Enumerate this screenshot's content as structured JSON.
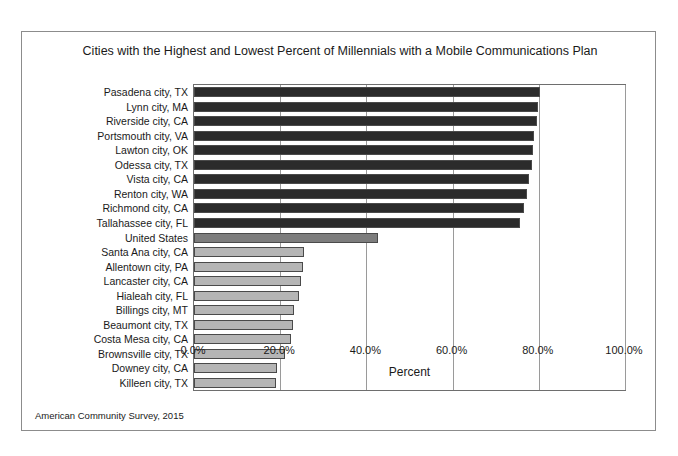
{
  "figure": {
    "title": "Cities with the Highest and Lowest Percent of Millennials with a Mobile Communications Plan",
    "source_note": "American Community Survey, 2015"
  },
  "colors": {
    "high_bar": "#2b2b2b",
    "national_bar": "#7d7d7d",
    "low_bar": "#b5b5b5",
    "bar_outline": "#4a4a4a",
    "gridline": "#9a9a9a",
    "frame": "#8c8c8c",
    "text": "#1a1a1a",
    "background": "#ffffff"
  },
  "chart_data": {
    "type": "bar",
    "orientation": "horizontal",
    "title": "Cities with the Highest and Lowest Percent of Millennials with a Mobile Communications Plan",
    "xlabel": "Percent",
    "ylabel": "",
    "xlim": [
      0,
      100
    ],
    "xticks": [
      0,
      20,
      40,
      60,
      80,
      100
    ],
    "xticklabels": [
      "0.0%",
      "20.0%",
      "40.0%",
      "60.0%",
      "80.0%",
      "100.0%"
    ],
    "grid": "vertical",
    "legend": "none",
    "categories": [
      "Pasadena city, TX",
      "Lynn city, MA",
      "Riverside city, CA",
      "Portsmouth city, VA",
      "Lawton city, OK",
      "Odessa city, TX",
      "Vista city, CA",
      "Renton city, WA",
      "Richmond city, CA",
      "Tallahassee city, FL",
      "United States",
      "Santa Ana city, CA",
      "Allentown city, PA",
      "Lancaster city, CA",
      "Hialeah city, FL",
      "Billings city, MT",
      "Beaumont city, TX",
      "Costa Mesa city, CA",
      "Brownsville city, TX",
      "Downey city, CA",
      "Killeen city, TX"
    ],
    "values": [
      80.3,
      79.8,
      79.6,
      79.0,
      78.7,
      78.4,
      77.8,
      77.3,
      76.5,
      75.6,
      42.8,
      25.5,
      25.4,
      24.9,
      24.3,
      23.2,
      23.0,
      22.6,
      21.1,
      19.3,
      19.0
    ],
    "groups": [
      "high",
      "high",
      "high",
      "high",
      "high",
      "high",
      "high",
      "high",
      "high",
      "high",
      "national",
      "low",
      "low",
      "low",
      "low",
      "low",
      "low",
      "low",
      "low",
      "low",
      "low"
    ]
  }
}
